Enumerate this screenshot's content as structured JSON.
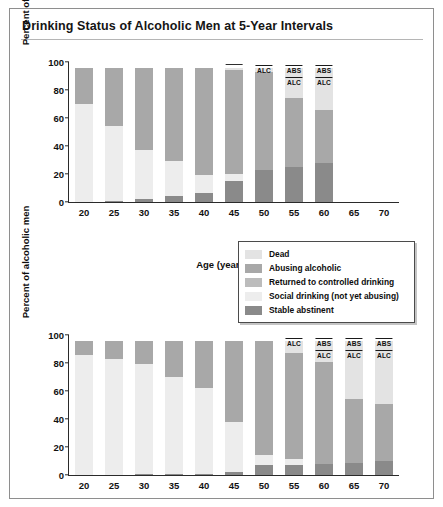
{
  "figure": {
    "title": "Drinking Status of Alcoholic Men at 5-Year Intervals"
  },
  "legend": {
    "items": [
      {
        "label": "Dead",
        "color": "#e3e3e3"
      },
      {
        "label": "Abusing alcoholic",
        "color": "#a8a8a8"
      },
      {
        "label": "Returned to controlled drinking",
        "color": "#bcbcbc"
      },
      {
        "label": "Social drinking (not yet abusing)",
        "color": "#ededed"
      },
      {
        "label": "Stable abstinent",
        "color": "#8a8a8a"
      }
    ]
  },
  "chart_data": [
    {
      "type": "bar",
      "subtype": "stacked",
      "panel": "top",
      "title": "Drinking Status of Alcoholic Men at 5-Year Intervals",
      "xlabel": "Age (years)",
      "ylabel": "Percent of alcoholic men",
      "categories": [
        "20",
        "25",
        "30",
        "35",
        "40",
        "45",
        "50",
        "55",
        "60",
        "65",
        "70"
      ],
      "yticks": [
        0,
        20,
        40,
        60,
        80,
        100
      ],
      "ylim": [
        0,
        100
      ],
      "grid": false,
      "legend_position": "center-right",
      "series": [
        {
          "name": "Stable abstinent",
          "color": "#8a8a8a",
          "values": [
            0,
            1,
            2.5,
            4,
            6.5,
            15,
            23,
            25,
            28,
            null,
            null
          ]
        },
        {
          "name": "Social drinking (not yet abusing)",
          "color": "#ededed",
          "values": [
            70,
            53,
            35,
            25,
            13,
            5,
            0,
            0,
            0,
            null,
            null
          ]
        },
        {
          "name": "Returned to controlled drinking",
          "color": "#bcbcbc",
          "values": [
            0,
            0,
            0,
            0,
            0,
            0,
            0,
            0,
            0,
            null,
            null
          ]
        },
        {
          "name": "Abusing alcoholic",
          "color": "#a8a8a8",
          "values": [
            26,
            42,
            58.5,
            67,
            76.5,
            74,
            70,
            49,
            38,
            null,
            null
          ]
        },
        {
          "name": "Dead",
          "color": "#e3e3e3",
          "values": [
            0,
            0,
            0,
            0,
            0,
            2,
            3,
            22,
            30,
            null,
            null
          ]
        }
      ],
      "annotations": [
        {
          "x": "45",
          "labels": [],
          "rule_only": true
        },
        {
          "x": "50",
          "labels": [
            "ALC"
          ]
        },
        {
          "x": "55",
          "labels": [
            "ABS",
            "ALC"
          ]
        },
        {
          "x": "60",
          "labels": [
            "ABS",
            "ALC"
          ]
        }
      ]
    },
    {
      "type": "bar",
      "subtype": "stacked",
      "panel": "bottom",
      "xlabel": "Age (years)",
      "ylabel": "Percent of alcoholic men",
      "categories": [
        "20",
        "25",
        "30",
        "35",
        "40",
        "45",
        "50",
        "55",
        "60",
        "65",
        "70"
      ],
      "yticks": [
        0,
        20,
        40,
        60,
        80,
        100
      ],
      "ylim": [
        0,
        100
      ],
      "grid": false,
      "series": [
        {
          "name": "Stable abstinent",
          "color": "#8a8a8a",
          "values": [
            0,
            0,
            1,
            1,
            1,
            2,
            7,
            7.5,
            8,
            8.5,
            10
          ]
        },
        {
          "name": "Social drinking (not yet abusing)",
          "color": "#ededed",
          "values": [
            86,
            83,
            78,
            69,
            61,
            36,
            7,
            4,
            0,
            0,
            0
          ]
        },
        {
          "name": "Returned to controlled drinking",
          "color": "#bcbcbc",
          "values": [
            0,
            0,
            0,
            0,
            0,
            0,
            0,
            0,
            0,
            0,
            0
          ]
        },
        {
          "name": "Abusing alcoholic",
          "color": "#a8a8a8",
          "values": [
            10,
            13,
            17,
            26,
            34,
            58,
            82,
            76,
            73,
            46,
            41
          ]
        },
        {
          "name": "Dead",
          "color": "#e3e3e3",
          "values": [
            0,
            0,
            0,
            0,
            0,
            0,
            0,
            8.5,
            15,
            41,
            45
          ]
        }
      ],
      "annotations": [
        {
          "x": "55",
          "labels": [
            "ALC"
          ]
        },
        {
          "x": "60",
          "labels": [
            "ABS",
            "ALC"
          ]
        },
        {
          "x": "65",
          "labels": [
            "ABS",
            "ALC"
          ]
        },
        {
          "x": "70",
          "labels": [
            "ABS",
            "ALC"
          ]
        }
      ]
    }
  ]
}
